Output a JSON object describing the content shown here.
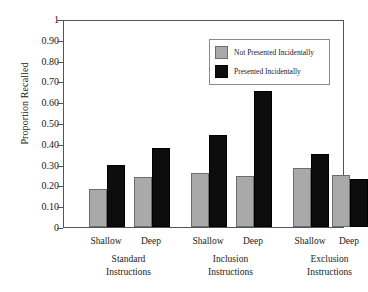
{
  "chart_data": {
    "type": "bar",
    "title": "",
    "xlabel": "",
    "ylabel": "Proportion Recalled",
    "ylim": [
      0,
      1
    ],
    "grid": false,
    "legend_position": "top-right",
    "ytick_labels": [
      "1",
      "0.90",
      "0.80",
      "0.70",
      "0.60",
      "0.50",
      "0.40",
      "0.30",
      "0.20",
      "0.10",
      "0"
    ],
    "ytick_values": [
      1,
      0.9,
      0.8,
      0.7,
      0.6,
      0.5,
      0.4,
      0.3,
      0.2,
      0.1,
      0
    ],
    "categories": [
      "Standard Instructions / Shallow",
      "Standard Instructions / Deep",
      "Inclusion Instructions / Shallow",
      "Inclusion Instructions / Deep",
      "Exclusion Instructions / Shallow",
      "Exclusion Instructions / Deep"
    ],
    "groups": [
      {
        "name": "Standard Instructions",
        "line1": "Standard",
        "line2": "Instructions",
        "conditions": [
          "Shallow",
          "Deep"
        ]
      },
      {
        "name": "Inclusion Instructions",
        "line1": "Inclusion",
        "line2": "Instructions",
        "conditions": [
          "Shallow",
          "Deep"
        ]
      },
      {
        "name": "Exclusion Instructions",
        "line1": "Exclusion",
        "line2": "Instructions",
        "conditions": [
          "Shallow",
          "Deep"
        ]
      }
    ],
    "series": [
      {
        "name": "Not Presented Incidentally",
        "color": "#a9a9a9",
        "values": [
          0.185,
          0.24,
          0.26,
          0.245,
          0.285,
          0.25
        ]
      },
      {
        "name": "Presented Incidentally",
        "color": "#0d0d0d",
        "values": [
          0.3,
          0.38,
          0.44,
          0.655,
          0.35,
          0.23
        ]
      }
    ]
  },
  "legend": {
    "items": [
      {
        "label": "Not Presented Incidentally",
        "swatch": "gray"
      },
      {
        "label": "Presented Incidentally",
        "swatch": "black"
      }
    ]
  }
}
